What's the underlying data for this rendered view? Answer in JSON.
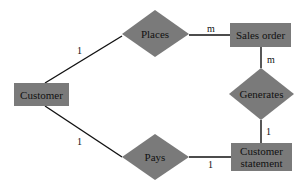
{
  "diagram": {
    "type": "entity-relationship",
    "colors": {
      "shape_fill": "#7a7a7a",
      "line": "#111111",
      "background": "#ffffff",
      "text": "#111111"
    },
    "entities": [
      {
        "id": "customer",
        "label": "Customer"
      },
      {
        "id": "sales_order",
        "label": "Sales order"
      },
      {
        "id": "customer_statement",
        "label_line1": "Customer",
        "label_line2": "statement"
      }
    ],
    "relationships": [
      {
        "id": "places",
        "label": "Places"
      },
      {
        "id": "generates",
        "label": "Generates"
      },
      {
        "id": "pays",
        "label": "Pays"
      }
    ],
    "cardinalities": {
      "customer_places": "1",
      "places_sales_order": "m",
      "sales_order_generates": "m",
      "generates_customer_statement": "1",
      "customer_pays": "1",
      "pays_customer_statement": "1"
    }
  }
}
